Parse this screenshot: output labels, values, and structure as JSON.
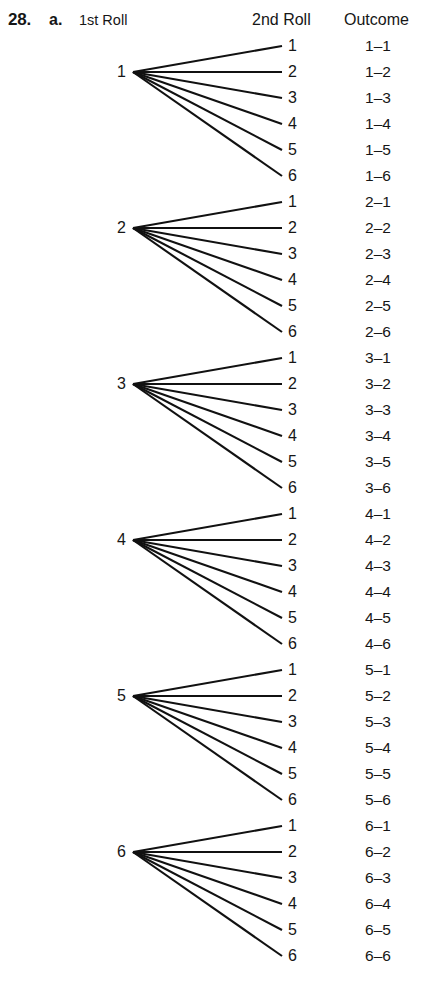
{
  "header": {
    "problem_number": "28.",
    "problem_part": "a.",
    "col_first_roll": "1st Roll",
    "col_second_roll": "2nd Roll",
    "col_outcome": "Outcome"
  },
  "diagram": {
    "type": "probability-tree",
    "ink_color": "#111111",
    "background_color": "#ffffff",
    "first_roll_values": [
      "1",
      "2",
      "3",
      "4",
      "5",
      "6"
    ],
    "second_roll_values": [
      "1",
      "2",
      "3",
      "4",
      "5",
      "6"
    ],
    "branches_per_node": 6,
    "total_outcomes": 36,
    "geometry": {
      "first_row_center_y": 46,
      "row_spacing": 26,
      "apex_x": 133,
      "branch_end_x": 282,
      "node_label_right_x": 126,
      "second_label_x": 288,
      "outcome_center_x": 378
    },
    "groups": [
      {
        "node": "1",
        "rows": [
          {
            "second": "1",
            "outcome": "1–1"
          },
          {
            "second": "2",
            "outcome": "1–2"
          },
          {
            "second": "3",
            "outcome": "1–3"
          },
          {
            "second": "4",
            "outcome": "1–4"
          },
          {
            "second": "5",
            "outcome": "1–5"
          },
          {
            "second": "6",
            "outcome": "1–6"
          }
        ]
      },
      {
        "node": "2",
        "rows": [
          {
            "second": "1",
            "outcome": "2–1"
          },
          {
            "second": "2",
            "outcome": "2–2"
          },
          {
            "second": "3",
            "outcome": "2–3"
          },
          {
            "second": "4",
            "outcome": "2–4"
          },
          {
            "second": "5",
            "outcome": "2–5"
          },
          {
            "second": "6",
            "outcome": "2–6"
          }
        ]
      },
      {
        "node": "3",
        "rows": [
          {
            "second": "1",
            "outcome": "3–1"
          },
          {
            "second": "2",
            "outcome": "3–2"
          },
          {
            "second": "3",
            "outcome": "3–3"
          },
          {
            "second": "4",
            "outcome": "3–4"
          },
          {
            "second": "5",
            "outcome": "3–5"
          },
          {
            "second": "6",
            "outcome": "3–6"
          }
        ]
      },
      {
        "node": "4",
        "rows": [
          {
            "second": "1",
            "outcome": "4–1"
          },
          {
            "second": "2",
            "outcome": "4–2"
          },
          {
            "second": "3",
            "outcome": "4–3"
          },
          {
            "second": "4",
            "outcome": "4–4"
          },
          {
            "second": "5",
            "outcome": "4–5"
          },
          {
            "second": "6",
            "outcome": "4–6"
          }
        ]
      },
      {
        "node": "5",
        "rows": [
          {
            "second": "1",
            "outcome": "5–1"
          },
          {
            "second": "2",
            "outcome": "5–2"
          },
          {
            "second": "3",
            "outcome": "5–3"
          },
          {
            "second": "4",
            "outcome": "5–4"
          },
          {
            "second": "5",
            "outcome": "5–5"
          },
          {
            "second": "6",
            "outcome": "5–6"
          }
        ]
      },
      {
        "node": "6",
        "rows": [
          {
            "second": "1",
            "outcome": "6–1"
          },
          {
            "second": "2",
            "outcome": "6–2"
          },
          {
            "second": "3",
            "outcome": "6–3"
          },
          {
            "second": "4",
            "outcome": "6–4"
          },
          {
            "second": "5",
            "outcome": "6–5"
          },
          {
            "second": "6",
            "outcome": "6–6"
          }
        ]
      }
    ]
  }
}
